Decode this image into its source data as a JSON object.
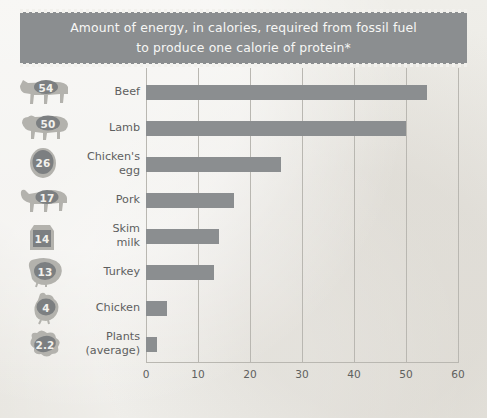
{
  "title": {
    "line1": "Amount of energy, in calories, required from fossil fuel",
    "line2": "to produce one calorie of protein*"
  },
  "colors": {
    "banner": "#8b8e90",
    "bar": "#8b8e90",
    "icon": "#b3b2ad",
    "badge": "#7c7f81",
    "background": "#ecebe6",
    "grid": "#b9b7b1",
    "label_text": "#5e5f5f",
    "title_text": "#f7f7f5"
  },
  "chart_data": {
    "type": "bar",
    "orientation": "horizontal",
    "title": "Amount of energy, in calories, required from fossil fuel to produce one calorie of protein*",
    "xlabel": "",
    "ylabel": "",
    "xlim": [
      0,
      60
    ],
    "xticks": [
      "0",
      "10",
      "20",
      "30",
      "40",
      "50",
      "60"
    ],
    "grid": true,
    "legend": "none",
    "categories": [
      "Beef",
      "Lamb",
      "Chicken's egg",
      "Pork",
      "Skim milk",
      "Turkey",
      "Chicken",
      "Plants (average)"
    ],
    "values": [
      54,
      50,
      26,
      17,
      14,
      13,
      4,
      2.2
    ],
    "value_labels": [
      "54",
      "50",
      "26",
      "17",
      "14",
      "13",
      "4",
      "2.2"
    ]
  },
  "rows": [
    {
      "label_line1": "Beef",
      "label_line2": "",
      "value": 54,
      "value_label": "54",
      "icon": "cow-icon"
    },
    {
      "label_line1": "Lamb",
      "label_line2": "",
      "value": 50,
      "value_label": "50",
      "icon": "sheep-icon"
    },
    {
      "label_line1": "Chicken's",
      "label_line2": "egg",
      "value": 26,
      "value_label": "26",
      "icon": "egg-icon"
    },
    {
      "label_line1": "Pork",
      "label_line2": "",
      "value": 17,
      "value_label": "17",
      "icon": "pig-icon"
    },
    {
      "label_line1": "Skim",
      "label_line2": "milk",
      "value": 14,
      "value_label": "14",
      "icon": "milk-carton-icon"
    },
    {
      "label_line1": "Turkey",
      "label_line2": "",
      "value": 13,
      "value_label": "13",
      "icon": "turkey-icon"
    },
    {
      "label_line1": "Chicken",
      "label_line2": "",
      "value": 4,
      "value_label": "4",
      "icon": "chicken-icon"
    },
    {
      "label_line1": "Plants",
      "label_line2": "(average)",
      "value": 2.2,
      "value_label": "2.2",
      "icon": "plants-icon"
    }
  ]
}
